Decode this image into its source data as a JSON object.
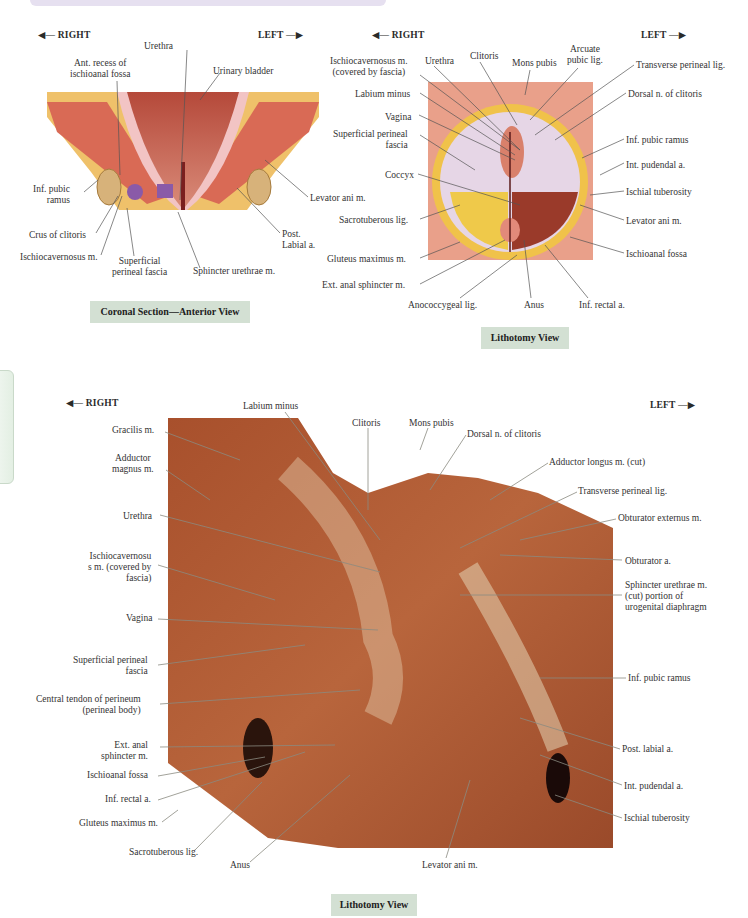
{
  "directions": {
    "right": "RIGHT",
    "left": "LEFT"
  },
  "coronal": {
    "caption": "Coronal Section—Anterior View",
    "labels": {
      "urethra": "Urethra",
      "ant_recess_1": "Ant. recess of",
      "ant_recess_2": "ischioanal fossa",
      "urinary_bladder": "Urinary bladder",
      "inf_pubic_ramus_1": "Inf. pubic",
      "inf_pubic_ramus_2": "ramus",
      "levator_ani": "Levator ani m.",
      "crus_clitoris": "Crus of clitoris",
      "post_labial_1": "Post.",
      "post_labial_2": "Labial a.",
      "ischiocavernosus": "Ischiocavernosus m.",
      "superficial_fascia_1": "Superficial",
      "superficial_fascia_2": "perineal fascia",
      "sphincter_urethrae": "Sphincter urethrae m."
    }
  },
  "lithotomy_illustration": {
    "caption": "Lithotomy View",
    "labels": {
      "ischiocav_1": "Ischiocavernosus m.",
      "ischiocav_2": "(covered by fascia)",
      "urethra": "Urethra",
      "clitoris": "Clitoris",
      "mons_pubis": "Mons pubis",
      "arcuate_1": "Arcuate",
      "arcuate_2": "pubic  lig.",
      "transverse_perineal": "Transverse perineal lig.",
      "labium_minus": "Labium minus",
      "dorsal_n": "Dorsal n. of clitoris",
      "vagina": "Vagina",
      "superficial_1": "Superficial perineal",
      "superficial_2": "fascia",
      "inf_pubic_ramus": "Inf. pubic ramus",
      "int_pudendal": "Int. pudendal a.",
      "coccyx": "Coccyx",
      "ischial_tuberosity": "Ischial tuberosity",
      "sacrotuberous": "Sacrotuberous lig.",
      "levator_ani": "Levator ani m.",
      "gluteus": "Gluteus maximus m.",
      "ischioanal": "Ischioanal fossa",
      "ext_anal": "Ext. anal sphincter m.",
      "anococcygeal": "Anococcygeal lig.",
      "anus": "Anus",
      "inf_rectal": "Inf. rectal a."
    }
  },
  "lithotomy_photo": {
    "caption": "Lithotomy View",
    "labels": {
      "labium_minus": "Labium minus",
      "clitoris": "Clitoris",
      "mons_pubis": "Mons pubis",
      "dorsal_n": "Dorsal n. of clitoris",
      "gracilis": "Gracilis m.",
      "adductor_magnus_1": "Adductor",
      "adductor_magnus_2": "magnus m.",
      "adductor_longus": "Adductor longus m. (cut)",
      "transverse_perineal": "Transverse perineal lig.",
      "urethra": "Urethra",
      "obturator_externus": "Obturator externus m.",
      "ischiocav_1": "Ischiocavernosu",
      "ischiocav_2": "s m. (covered by",
      "ischiocav_3": "fascia)",
      "obturator_a": "Obturator a.",
      "sphincter_1": "Sphincter urethrae m.",
      "sphincter_2": "(cut) portion of",
      "sphincter_3": "urogenital diaphragm",
      "vagina": "Vagina",
      "superficial_1": "Superficial perineal",
      "superficial_2": "fascia",
      "inf_pubic_ramus": "Inf. pubic ramus",
      "central_tendon_1": "Central tendon of perineum",
      "central_tendon_2": "(perineal body)",
      "ext_anal_1": "Ext. anal",
      "ext_anal_2": "sphincter m.",
      "post_labial": "Post. labial a.",
      "ischioanal": "Ischioanal fossa",
      "int_pudendal": "Int. pudendal a.",
      "inf_rectal": "Inf. rectal a.",
      "ischial_tuberosity": "Ischial tuberosity",
      "gluteus": "Gluteus maximus m.",
      "sacrotuberous": "Sacrotuberous lig.",
      "anus": "Anus",
      "levator_ani": "Levator ani m."
    }
  },
  "colors": {
    "caption_bg": "#d3e0d3",
    "top_band": "#e6e0f0",
    "photo_tissue": "#a9552f",
    "illustration_fat": "#f0c24a",
    "illustration_muscle": "#d9705a"
  }
}
